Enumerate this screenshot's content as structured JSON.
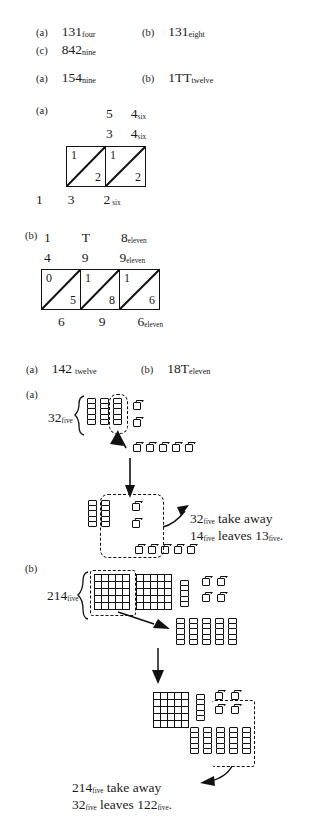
{
  "page": {
    "background": "#ffffff",
    "ink": "#1a1a1a"
  },
  "sections": [
    {
      "id": "s1",
      "items": [
        {
          "tag": "(a)",
          "value": "131",
          "base": "four"
        },
        {
          "tag": "(b)",
          "value": "131",
          "base": "eight"
        },
        {
          "tag": "(c)",
          "value": "842",
          "base": "nine"
        }
      ]
    },
    {
      "id": "s2",
      "items": [
        {
          "tag": "(a)",
          "value": "154",
          "base": "nine"
        },
        {
          "tag": "(b)",
          "value": "1TT",
          "base": "twelve"
        }
      ]
    }
  ],
  "lattice_a": {
    "tag": "(a)",
    "top_row": {
      "digits": [
        "5",
        "4"
      ],
      "base": "six"
    },
    "second_row": {
      "digits": [
        "3",
        "4"
      ],
      "base": "six"
    },
    "cells": [
      {
        "upper": "1",
        "lower": "2"
      },
      {
        "upper": "1",
        "lower": "2"
      }
    ],
    "bottom_row": {
      "digits": [
        "1",
        "3",
        "2"
      ],
      "base": "six"
    }
  },
  "lattice_b": {
    "tag": "(b)",
    "top_row": {
      "digits": [
        "1",
        "T",
        "8"
      ],
      "base": "eleven"
    },
    "second_row": {
      "digits": [
        "4",
        "9",
        "9"
      ],
      "base": "eleven"
    },
    "cells": [
      {
        "upper": "0",
        "lower": "5"
      },
      {
        "upper": "1",
        "lower": "8"
      },
      {
        "upper": "1",
        "lower": "6"
      }
    ],
    "bottom_row": {
      "digits": [
        "6",
        "9",
        "6"
      ],
      "base": "eleven"
    }
  },
  "section3": {
    "items": [
      {
        "tag": "(a)",
        "value": "142",
        "base": "twelve"
      },
      {
        "tag": "(b)",
        "value": "18T",
        "base": "eleven"
      }
    ]
  },
  "blocks_a": {
    "tag": "(a)",
    "label": {
      "value": "32",
      "base": "five"
    },
    "start": {
      "rods": 3,
      "cubes": 2,
      "rod_size": 5,
      "dashed_rod_index": 3,
      "traded_cubes": 5
    },
    "result": {
      "rods": 2,
      "cubes_in_box": 2,
      "cubes_bottom_in_box": 2,
      "cubes_bottom_out": 3
    },
    "caption_line1": {
      "value": "32",
      "base": "five",
      "text": " take away"
    },
    "caption_line2": {
      "value": "14",
      "base": "five",
      "text": " leaves ",
      "value2": "13",
      "base2": "five",
      "end": "."
    }
  },
  "blocks_b": {
    "tag": "(b)",
    "label": {
      "value": "214",
      "base": "five"
    },
    "start": {
      "flats": 2,
      "rods": 1,
      "cubes": 4,
      "flat_size": 5,
      "dashed_flat_index": 1
    },
    "traded": {
      "rods": 5
    },
    "final": {
      "flats": 1,
      "rods_top": 1,
      "cubes": 4,
      "rods_bottom": 5,
      "dashed_group": "3 rods + 2 cubes"
    },
    "caption_line1": {
      "value": "214",
      "base": "five",
      "text": " take away"
    },
    "caption_line2": {
      "value": "32",
      "base": "five",
      "text": " leaves ",
      "value2": "122",
      "base2": "five",
      "end": "."
    }
  }
}
